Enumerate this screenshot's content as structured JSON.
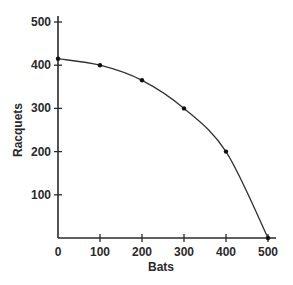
{
  "chart_data": {
    "type": "line",
    "title": "",
    "xlabel": "Bats",
    "ylabel": "Racquets",
    "xlim": [
      0,
      500
    ],
    "ylim": [
      0,
      500
    ],
    "grid": false,
    "legend": null,
    "x_ticks": [
      0,
      100,
      200,
      300,
      400,
      500
    ],
    "y_ticks": [
      100,
      200,
      300,
      400,
      500
    ],
    "series": [
      {
        "name": "Production possibilities frontier",
        "x": [
          0,
          100,
          200,
          300,
          400,
          500
        ],
        "y": [
          415,
          400,
          365,
          300,
          200,
          0
        ],
        "markers": true,
        "curve": "smooth"
      }
    ]
  },
  "colors": {
    "line": "#333333",
    "axis": "#2a2a2a",
    "background": "#ffffff"
  }
}
